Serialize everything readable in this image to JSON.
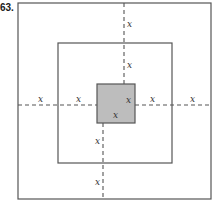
{
  "problem": {
    "number": "63."
  },
  "diagram": {
    "label": "x",
    "colors": {
      "line": "#555555",
      "fill_inner": "#bdbdbd",
      "dash": "#555555"
    },
    "outer_square": {
      "x": 18,
      "y": 3,
      "w": 193,
      "h": 196
    },
    "middle_square": {
      "x": 58,
      "y": 43,
      "w": 114,
      "h": 120
    },
    "inner_square": {
      "x": 97,
      "y": 84,
      "w": 38,
      "h": 39
    },
    "labels": [
      {
        "id": "left-outer",
        "text": "x",
        "x": 38,
        "y": 102
      },
      {
        "id": "left-middle",
        "text": "x",
        "x": 76,
        "y": 102
      },
      {
        "id": "inner-right",
        "text": "x",
        "x": 126,
        "y": 103
      },
      {
        "id": "right-middle",
        "text": "x",
        "x": 150,
        "y": 102
      },
      {
        "id": "right-outer",
        "text": "x",
        "x": 190,
        "y": 102
      },
      {
        "id": "top-outer",
        "text": "x",
        "x": 127,
        "y": 27
      },
      {
        "id": "top-middle",
        "text": "x",
        "x": 127,
        "y": 68
      },
      {
        "id": "inner-bottom",
        "text": "x",
        "x": 113,
        "y": 118
      },
      {
        "id": "bottom-middle",
        "text": "x",
        "x": 95,
        "y": 144
      },
      {
        "id": "bottom-outer",
        "text": "x",
        "x": 95,
        "y": 185
      }
    ]
  }
}
